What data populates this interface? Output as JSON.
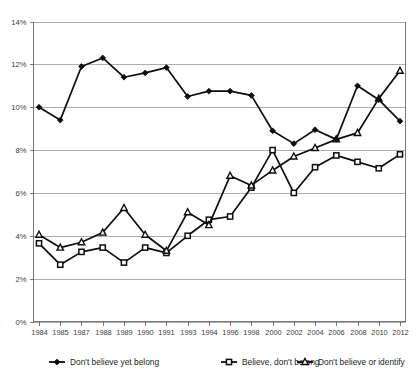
{
  "chart_data": {
    "type": "line",
    "title": "",
    "subtitle": "",
    "xlabel": "",
    "ylabel": "",
    "grid": true,
    "legend_position": "bottom",
    "ylim": [
      0,
      14
    ],
    "ytick_labels": [
      "0%",
      "2%",
      "4%",
      "6%",
      "8%",
      "10%",
      "12%",
      "14%"
    ],
    "ytick_values": [
      0,
      2,
      4,
      6,
      8,
      10,
      12,
      14
    ],
    "categories": [
      "1984",
      "1985",
      "1987",
      "1988",
      "1989",
      "1990",
      "1991",
      "1993",
      "1994",
      "1996",
      "1998",
      "2000",
      "2002",
      "2004",
      "2006",
      "2008",
      "2010",
      "2012"
    ],
    "series": [
      {
        "name": "Don't believe yet belong",
        "marker": "diamond-filled",
        "values": [
          10.0,
          9.4,
          11.9,
          12.3,
          11.4,
          11.6,
          11.85,
          10.5,
          10.75,
          10.75,
          10.55,
          8.9,
          8.3,
          8.95,
          8.5,
          11.0,
          10.35,
          9.35
        ]
      },
      {
        "name": "Believe, don't belong",
        "marker": "square-open",
        "values": [
          3.65,
          2.65,
          3.25,
          3.45,
          2.75,
          3.45,
          3.2,
          4.0,
          4.75,
          4.9,
          6.25,
          8.0,
          6.0,
          7.2,
          7.75,
          7.45,
          7.15,
          7.8
        ]
      },
      {
        "name": "Don't believe or identify",
        "marker": "triangle-open",
        "values": [
          4.05,
          3.45,
          3.7,
          4.15,
          5.3,
          4.05,
          3.3,
          5.1,
          4.5,
          6.8,
          6.35,
          7.05,
          7.7,
          8.1,
          8.5,
          8.8,
          10.4,
          11.7
        ]
      }
    ]
  },
  "legend": {
    "items": [
      {
        "label": "Don't believe yet belong",
        "marker": "diamond-filled"
      },
      {
        "label": "Believe, don't belong",
        "marker": "square-open"
      },
      {
        "label": "Don't believe or identify",
        "marker": "triangle-open"
      }
    ]
  },
  "colors": {
    "series_stroke": "#0d0d0d",
    "gridline": "#8c8c8c",
    "axis": "#555555",
    "text": "#231f20",
    "background": "#ffffff",
    "marker_fill": "#ffffff"
  }
}
